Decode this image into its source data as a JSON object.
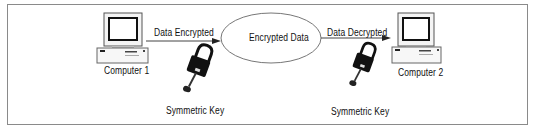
{
  "diagram": {
    "nodes": {
      "computer1": "Computer 1",
      "computer2": "Computer 2",
      "cloud": "Encrypted Data"
    },
    "edges": {
      "encrypt": "Data Encrypted",
      "decrypt": "Data Decrypted"
    },
    "keys": {
      "left": "Symmetric Key",
      "right": "Symmetric Key"
    }
  }
}
